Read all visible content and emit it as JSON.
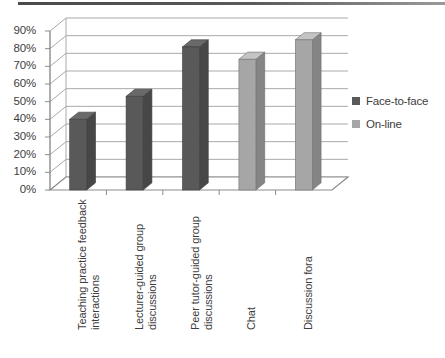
{
  "chart_data": {
    "type": "bar",
    "title": "",
    "subtitle": "",
    "xlabel": "",
    "ylabel": "",
    "ylim": [
      0,
      90
    ],
    "grid": true,
    "style": "3d-column",
    "legend_position": "right",
    "categories": [
      "Teaching practice feedback interactions",
      "Lecturer-guided group discussions",
      "Peer tutor-guided group discussions",
      "Chat",
      "Discussion fora"
    ],
    "category_lines": [
      [
        "Teaching practice feedback",
        "interactions"
      ],
      [
        "Lecturer-guided group",
        "discussions"
      ],
      [
        "Peer tutor-guided group",
        "discussions"
      ],
      [
        "Chat",
        ""
      ],
      [
        "Discussion fora",
        ""
      ]
    ],
    "ytick_labels": [
      "90%",
      "80%",
      "70%",
      "60%",
      "50%",
      "40%",
      "30%",
      "20%",
      "10%",
      "0%"
    ],
    "ytick_values": [
      90,
      80,
      70,
      60,
      50,
      40,
      30,
      20,
      10,
      0
    ],
    "series": [
      {
        "name": "Face-to-face",
        "color": "#595959",
        "values": [
          40,
          53,
          81,
          null,
          null
        ]
      },
      {
        "name": "On-line",
        "color": "#a6a6a6",
        "values": [
          null,
          null,
          null,
          74,
          85
        ]
      }
    ]
  },
  "legend": {
    "items": [
      {
        "label": "Face-to-face",
        "color": "#595959"
      },
      {
        "label": "On-line",
        "color": "#a6a6a6"
      }
    ]
  },
  "colors": {
    "face_to_face": "#595959",
    "online": "#a6a6a6",
    "gridline": "#a9a9a9",
    "axis": "#8c8c8c",
    "text": "#3d3d3d",
    "floor": "#ffffff"
  }
}
